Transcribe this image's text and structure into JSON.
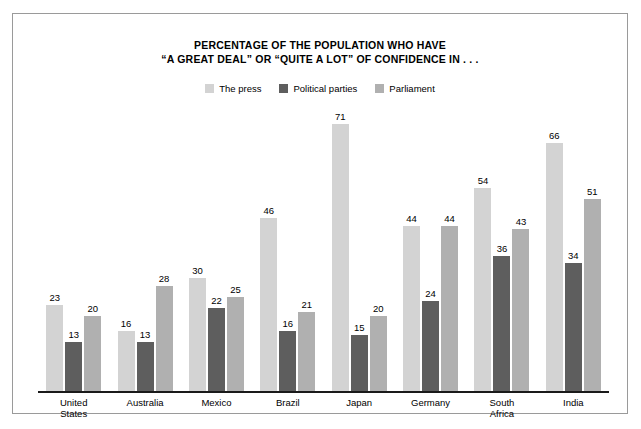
{
  "figure": {
    "title_lines": [
      "PERCENTAGE OF THE POPULATION WHO HAVE",
      "“A GREAT DEAL” OR “QUITE A LOT” OF CONFIDENCE IN . . ."
    ],
    "border_color": "#9a9a9a",
    "background": "#ffffff",
    "axis_color": "#1a1a1a"
  },
  "chart_data": {
    "type": "bar",
    "title": "PERCENTAGE OF THE POPULATION WHO HAVE “A GREAT DEAL” OR “QUITE A LOT” OF CONFIDENCE IN . . .",
    "xlabel": "",
    "ylabel": "",
    "ylim": [
      0,
      75
    ],
    "grid": false,
    "legend_position": "top-center",
    "value_labels": true,
    "categories": [
      "United States",
      "Australia",
      "Mexico",
      "Brazil",
      "Japan",
      "Germany",
      "South Africa",
      "India"
    ],
    "category_lines": [
      [
        "United",
        "States"
      ],
      [
        "Australia"
      ],
      [
        "Mexico"
      ],
      [
        "Brazil"
      ],
      [
        "Japan"
      ],
      [
        "Germany"
      ],
      [
        "South",
        "Africa"
      ],
      [
        "India"
      ]
    ],
    "series": [
      {
        "name": "The press",
        "color": "#d3d3d3",
        "values": [
          23,
          16,
          30,
          46,
          71,
          44,
          54,
          66
        ]
      },
      {
        "name": "Political parties",
        "color": "#5e5e5e",
        "values": [
          13,
          13,
          22,
          16,
          15,
          24,
          36,
          34
        ]
      },
      {
        "name": "Parliament",
        "color": "#b0b0b0",
        "values": [
          20,
          28,
          25,
          21,
          20,
          44,
          43,
          51
        ]
      }
    ]
  }
}
